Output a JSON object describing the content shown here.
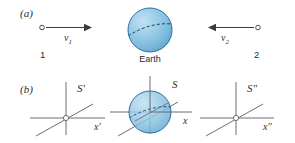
{
  "figure": {
    "background_color": "#ffffff",
    "width": 295,
    "height": 143
  },
  "panel_a": {
    "label": "(a)",
    "left_particle": {
      "number_label": "1",
      "velocity_symbol": "v",
      "velocity_subscript": "1",
      "arrow_direction": "right"
    },
    "center_body": {
      "label": "Earth",
      "shape": "sphere",
      "fill_color": "#8fc4e3",
      "outline_color": "#2e6f9e",
      "has_dashed_equator": true
    },
    "right_particle": {
      "number_label": "2",
      "velocity_symbol": "v",
      "velocity_subscript": "2",
      "arrow_direction": "left"
    }
  },
  "panel_b": {
    "label": "(b)",
    "frames": [
      {
        "name": "frame-s-prime",
        "frame_label": "S",
        "frame_prime": "′",
        "axis_label": "x",
        "axis_prime": "′",
        "has_sphere": false
      },
      {
        "name": "frame-s",
        "frame_label": "S",
        "frame_prime": "",
        "axis_label": "x",
        "axis_prime": "",
        "has_sphere": true,
        "sphere_fill_color": "#8fc4e3",
        "sphere_outline_color": "#2e6f9e"
      },
      {
        "name": "frame-s-double-prime",
        "frame_label": "S",
        "frame_prime": "″",
        "axis_label": "x",
        "axis_prime": "″",
        "has_sphere": false
      }
    ],
    "axis_color": "#6e6e72"
  }
}
